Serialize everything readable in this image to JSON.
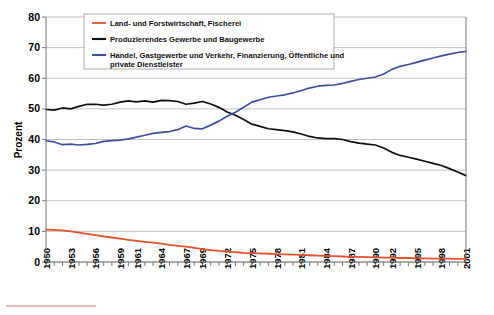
{
  "chart_data": {
    "type": "line",
    "title": "",
    "xlabel": "",
    "ylabel": "Prozent",
    "ylim": [
      0,
      80
    ],
    "ytick_step": 10,
    "yticks": [
      "0",
      "10",
      "20",
      "30",
      "40",
      "50",
      "60",
      "70",
      "80"
    ],
    "grid": true,
    "legend_position": "top-center",
    "xlim": [
      1950,
      2001
    ],
    "x": [
      1950,
      1951,
      1952,
      1953,
      1954,
      1955,
      1956,
      1957,
      1958,
      1959,
      1960,
      1961,
      1962,
      1963,
      1964,
      1965,
      1966,
      1967,
      1968,
      1969,
      1970,
      1971,
      1972,
      1973,
      1974,
      1975,
      1976,
      1977,
      1978,
      1979,
      1980,
      1981,
      1982,
      1983,
      1984,
      1985,
      1986,
      1987,
      1988,
      1989,
      1990,
      1991,
      1992,
      1993,
      1994,
      1995,
      1996,
      1997,
      1998,
      1999,
      2000,
      2001
    ],
    "xticklabels": [
      "1950",
      "1953",
      "1956",
      "1959",
      "1961",
      "1964",
      "1967",
      "1969",
      "1972",
      "1975",
      "1978",
      "1981",
      "1984",
      "1987",
      "1990",
      "1992",
      "1995",
      "1998",
      "2001"
    ],
    "xticklabel_years": [
      1950,
      1953,
      1956,
      1959,
      1961,
      1964,
      1967,
      1969,
      1972,
      1975,
      1978,
      1981,
      1984,
      1987,
      1990,
      1992,
      1995,
      1998,
      2001
    ],
    "series": [
      {
        "name": "Land- und Forstwirtschaft, Fischerei",
        "color": "#E8502A",
        "values": [
          10.6,
          10.5,
          10.3,
          10.0,
          9.6,
          9.2,
          8.8,
          8.4,
          8.0,
          7.6,
          7.2,
          6.9,
          6.6,
          6.3,
          6.0,
          5.6,
          5.3,
          5.0,
          4.6,
          4.2,
          3.9,
          3.6,
          3.4,
          3.2,
          3.0,
          2.9,
          2.8,
          2.7,
          2.6,
          2.5,
          2.4,
          2.3,
          2.2,
          2.1,
          2.0,
          1.9,
          1.8,
          1.7,
          1.7,
          1.6,
          1.5,
          1.4,
          1.4,
          1.3,
          1.3,
          1.2,
          1.2,
          1.1,
          1.1,
          1.1,
          1.0,
          1.0
        ]
      },
      {
        "name": "Produzierendes Gewerbe und Baugewerbe",
        "color": "#101010",
        "values": [
          49.8,
          49.6,
          50.3,
          50.0,
          50.8,
          51.5,
          51.5,
          51.2,
          51.5,
          52.2,
          52.6,
          52.3,
          52.6,
          52.2,
          52.8,
          52.7,
          52.4,
          51.5,
          51.9,
          52.4,
          51.6,
          50.5,
          49.0,
          47.9,
          46.5,
          45.0,
          44.3,
          43.5,
          43.2,
          42.9,
          42.5,
          41.8,
          41.0,
          40.5,
          40.3,
          40.3,
          40.0,
          39.3,
          38.8,
          38.5,
          38.2,
          37.2,
          35.8,
          34.8,
          34.2,
          33.6,
          32.9,
          32.2,
          31.5,
          30.5,
          29.4,
          28.2
        ]
      },
      {
        "name": "Handel, Gastgewerbe und Verkehr, Finanzierung, Öffentliche und private Dienstleister",
        "color": "#3B4E9B",
        "values": [
          39.6,
          39.2,
          38.3,
          38.5,
          38.2,
          38.4,
          38.7,
          39.4,
          39.6,
          39.8,
          40.2,
          40.8,
          41.4,
          42.0,
          42.3,
          42.6,
          43.2,
          44.4,
          43.6,
          43.5,
          44.7,
          46.0,
          47.6,
          48.9,
          50.5,
          52.2,
          53.0,
          53.8,
          54.2,
          54.6,
          55.2,
          56.0,
          56.8,
          57.4,
          57.7,
          57.8,
          58.3,
          59.0,
          59.6,
          60.0,
          60.4,
          61.4,
          62.9,
          63.9,
          64.5,
          65.2,
          65.9,
          66.6,
          67.3,
          67.9,
          68.4,
          68.8
        ]
      }
    ]
  },
  "legend": {
    "entries": [
      "Land- und Forstwirtschaft, Fischerei",
      "Produzierendes Gewerbe und Baugewerbe",
      "Handel, Gastgewerbe und Verkehr, Finanzierung, Öffentliche und",
      "private Dienstleister"
    ]
  },
  "colors": {
    "series_agriculture": "#E8502A",
    "series_industry": "#101010",
    "series_services": "#3B4E9B",
    "gridline": "#b0b0b0",
    "footer_rule": "#d9a99b"
  }
}
